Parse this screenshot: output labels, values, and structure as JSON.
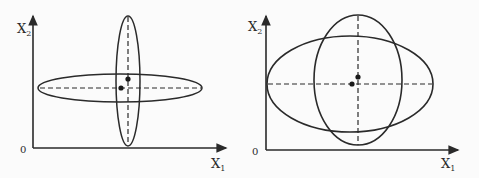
{
  "figure": {
    "colors": {
      "ink": "#2a2a2a",
      "background": "#fbfbfb"
    },
    "panels": [
      {
        "id": "left",
        "origin_label": "0",
        "x_axis_label": "X",
        "x_axis_sub": "1",
        "y_axis_label": "X",
        "y_axis_sub": "2",
        "description": "Narrow horizontal and vertical ellipses crossing; two centroid dots"
      },
      {
        "id": "right",
        "origin_label": "0",
        "x_axis_label": "X",
        "x_axis_sub": "1",
        "y_axis_label": "X",
        "y_axis_sub": "2",
        "description": "Wide horizontal and vertical ellipses overlapping; two centroid dots"
      }
    ]
  }
}
